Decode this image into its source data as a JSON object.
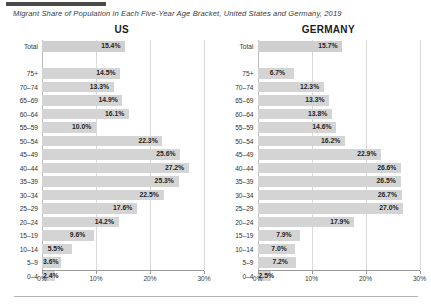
{
  "title": "Migrant Share of Population in Each Five-Year Age Bracket, United States and Germany, 2019",
  "colors": {
    "bar": "#d4d4d4",
    "text": "#1f1f1f",
    "gridline": "#d9d9d9",
    "axis": "#9a9a9a",
    "title": "#3a3a3a"
  },
  "chart_data": {
    "type": "bar",
    "title": "Migrant Share of Population in Each Five-Year Age Bracket, United States and Germany, 2019",
    "xlabel": "",
    "ylabel": "",
    "orientation": "horizontal",
    "xlim": [
      0,
      30
    ],
    "xticks": [
      0,
      10,
      20,
      30
    ],
    "xtick_labels": [
      "0%",
      "10%",
      "20%",
      "30%"
    ],
    "grid": true,
    "legend": "none",
    "categories": [
      "Total",
      "",
      "75+",
      "70–74",
      "65–69",
      "60–64",
      "55–59",
      "50–54",
      "45–49",
      "40–44",
      "35–39",
      "30–34",
      "25–29",
      "20–24",
      "15–19",
      "10–14",
      "5–9",
      "0–4"
    ],
    "panels": [
      {
        "name": "US",
        "label": "US",
        "values": [
          15.4,
          null,
          14.5,
          13.3,
          14.9,
          16.1,
          10.0,
          22.3,
          25.6,
          27.2,
          25.3,
          22.5,
          17.6,
          14.2,
          9.6,
          5.5,
          3.6,
          2.4
        ],
        "value_labels": [
          "15.4%",
          "",
          "14.5%",
          "13.3%",
          "14.9%",
          "16.1%",
          "10.0%",
          "22.3%",
          "25.6%",
          "27.2%",
          "25.3%",
          "22.5%",
          "17.6%",
          "14.2%",
          "9.6%",
          "5.5%",
          "3.6%",
          "2.4%"
        ]
      },
      {
        "name": "GERMANY",
        "label": "GERMANY",
        "values": [
          15.7,
          null,
          6.7,
          12.3,
          13.3,
          13.8,
          14.6,
          16.2,
          22.9,
          26.6,
          26.5,
          26.7,
          27.0,
          17.9,
          7.9,
          7.0,
          7.2,
          2.5
        ],
        "value_labels": [
          "15.7%",
          "",
          "6.7%",
          "12.3%",
          "13.3%",
          "13.8%",
          "14.6%",
          "16.2%",
          "22.9%",
          "26.6%",
          "26.5%",
          "26.7%",
          "27.0%",
          "17.9%",
          "7.9%",
          "7.0%",
          "7.2%",
          "2.5%"
        ]
      }
    ]
  }
}
